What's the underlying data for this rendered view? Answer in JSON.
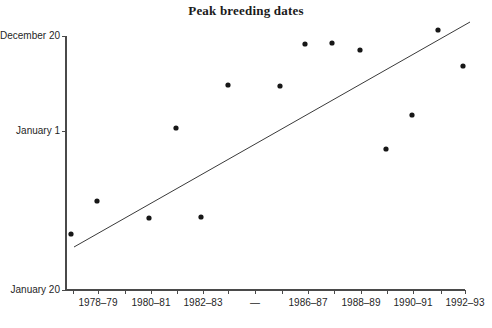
{
  "chart_data": {
    "type": "scatter",
    "title": "Peak breeding dates",
    "xlabel": "",
    "ylabel": "",
    "grid": false,
    "legend": null,
    "x_tick_labels": [
      "",
      "1978–79",
      "",
      "1980–81",
      "",
      "1982–83",
      "",
      "—",
      "",
      "1986–87",
      "",
      "1988–89",
      "",
      "1990–91",
      "",
      "1992–93"
    ],
    "x_tick_positions_px": [
      73,
      98,
      125,
      151,
      177,
      203,
      228,
      255,
      282,
      308,
      334,
      361,
      387,
      413,
      441,
      465
    ],
    "y_tick_labels": [
      "December 20",
      "January 1",
      "January 20"
    ],
    "y_tick_positions_px": [
      36,
      131,
      290
    ],
    "x_axis_range_px": [
      66,
      465
    ],
    "y_axis_range_px": [
      36,
      290
    ],
    "x_categories": [
      "1977–78",
      "1978–79",
      "1979–80",
      "1980–81",
      "1981–82",
      "1982–83",
      "1983–84",
      "1984–85",
      "1985–86",
      "1986–87",
      "1987–88",
      "1988–89",
      "1989–90",
      "1990–91",
      "1991–92",
      "1992–93"
    ],
    "points": [
      {
        "season": "1977–78",
        "px": 71,
        "py": 234,
        "date": "January 4"
      },
      {
        "season": "1978–79",
        "px": 97,
        "py": 201,
        "date": "December 31"
      },
      {
        "season": "1980–81",
        "px": 149,
        "py": 218,
        "date": "January 2"
      },
      {
        "season": "1981–82",
        "px": 176,
        "py": 128,
        "date": "January 1"
      },
      {
        "season": "1982–83",
        "px": 201,
        "py": 217,
        "date": "January 2"
      },
      {
        "season": "1983–84",
        "px": 228,
        "py": 85,
        "date": "December 26"
      },
      {
        "season": "1985–86",
        "px": 280,
        "py": 86,
        "date": "December 26"
      },
      {
        "season": "1986–87",
        "px": 305,
        "py": 44,
        "date": "December 21"
      },
      {
        "season": "1987–88",
        "px": 332,
        "py": 43,
        "date": "December 21"
      },
      {
        "season": "1988–89",
        "px": 360,
        "py": 50,
        "date": "December 22"
      },
      {
        "season": "1989–90",
        "px": 386,
        "py": 149,
        "date": "January 3"
      },
      {
        "season": "1990–91",
        "px": 412,
        "py": 115,
        "date": "December 30"
      },
      {
        "season": "1991–92",
        "px": 438,
        "py": 30,
        "date": "December 19"
      },
      {
        "season": "1992–93",
        "px": 463,
        "py": 66,
        "date": "December 24"
      }
    ],
    "trend_line": {
      "x1": 74,
      "y1": 247,
      "x2": 470,
      "y2": 22
    }
  },
  "colors": {
    "background": "#ffffff",
    "axis": "#4a4a4a",
    "point": "#171717",
    "trend": "#3a3a3a",
    "text": "#1f1f1f",
    "title": "#1b1b1b"
  }
}
